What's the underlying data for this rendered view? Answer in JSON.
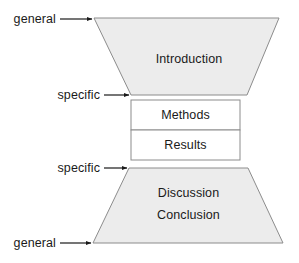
{
  "diagram": {
    "type": "hourglass-structure",
    "colors": {
      "background": "#ffffff",
      "trapezoid_fill": "#ececec",
      "trapezoid_stroke": "#8c8c8c",
      "box_fill": "#ffffff",
      "box_stroke": "#8c8c8c",
      "arrow_color": "#1a1a1a",
      "text_color": "#1a1a1a"
    },
    "sections": [
      {
        "id": "introduction",
        "label": "Introduction",
        "shape": "trapezoid-down"
      },
      {
        "id": "methods",
        "label": "Methods",
        "shape": "rectangle"
      },
      {
        "id": "results",
        "label": "Results",
        "shape": "rectangle"
      },
      {
        "id": "discussion",
        "label": "Discussion",
        "shape": "trapezoid-up"
      },
      {
        "id": "conclusion",
        "label": "Conclusion",
        "shape": "trapezoid-up"
      }
    ],
    "annotations": [
      {
        "id": "general-top",
        "label": "general",
        "points_to": "introduction-top"
      },
      {
        "id": "specific-top",
        "label": "specific",
        "points_to": "introduction-bottom"
      },
      {
        "id": "specific-bottom",
        "label": "specific",
        "points_to": "discussion-top"
      },
      {
        "id": "general-bottom",
        "label": "general",
        "points_to": "conclusion-bottom"
      }
    ]
  }
}
